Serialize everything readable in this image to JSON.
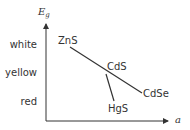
{
  "axes": {
    "y_label": "E",
    "y_label_sub": "g",
    "x_label": "a"
  },
  "color_levels": [
    {
      "label": "white",
      "y": 48
    },
    {
      "label": "yellow",
      "y": 76
    },
    {
      "label": "red",
      "y": 105
    }
  ],
  "compounds": [
    {
      "label": "ZnS",
      "x": 58,
      "y": 44
    },
    {
      "label": "CdS",
      "x": 107,
      "y": 70
    },
    {
      "label": "CdSe",
      "x": 143,
      "y": 97
    },
    {
      "label": "HgS",
      "x": 108,
      "y": 112
    }
  ],
  "lines": [
    {
      "from": "ZnS",
      "to": "CdSe",
      "x1": 70,
      "y1": 47,
      "x2": 142,
      "y2": 93
    },
    {
      "from": "CdS",
      "to": "HgS",
      "x1": 106,
      "y1": 74,
      "x2": 114,
      "y2": 101
    }
  ],
  "colors": {
    "line": "#333333",
    "text": "#333333"
  }
}
